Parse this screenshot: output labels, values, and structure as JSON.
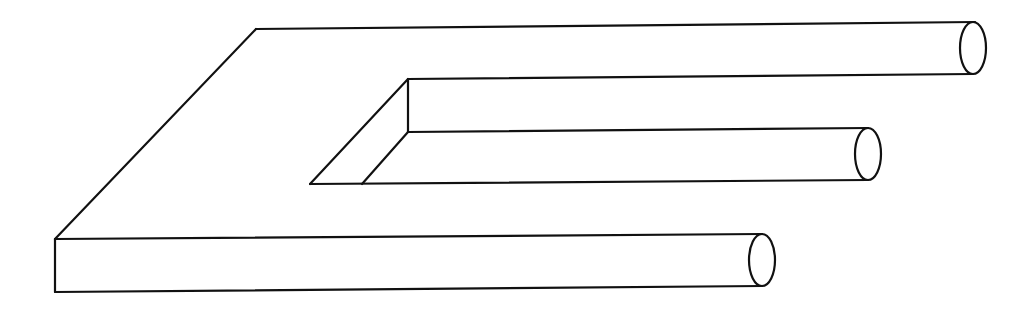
{
  "figure": {
    "title": "Impossible trident (blivet) optical illusion",
    "style": {
      "line_color": "#111111",
      "background": "#ffffff"
    },
    "outer_body": {
      "back_edge": [
        [
          256,
          29
        ],
        [
          975,
          22
        ]
      ],
      "left_diagonal": [
        [
          256,
          29
        ],
        [
          55,
          239
        ]
      ],
      "front_top_edge": [
        [
          55,
          239
        ],
        [
          762,
          234
        ]
      ],
      "front_left_edge": [
        [
          55,
          239
        ],
        [
          55,
          292
        ]
      ],
      "front_bottom_edge": [
        [
          55,
          292
        ],
        [
          762,
          286
        ]
      ]
    },
    "inner_notch": {
      "top_corner": [
        408,
        79
      ],
      "vertical_edge": [
        [
          408,
          79
        ],
        [
          408,
          132
        ]
      ],
      "outer_diagonal": [
        [
          408,
          79
        ],
        [
          310,
          184
        ]
      ],
      "inner_diagonal": [
        [
          408,
          132
        ],
        [
          362,
          184
        ]
      ],
      "floor_edge": [
        [
          310,
          184
        ],
        [
          868,
          180
        ]
      ],
      "upper_edge": [
        [
          408,
          79
        ],
        [
          973,
          74
        ]
      ],
      "middle_edge": [
        [
          408,
          132
        ],
        [
          868,
          128
        ]
      ]
    },
    "prongs": [
      {
        "name": "top-prong",
        "end_center": [
          973,
          48
        ],
        "rx": 13,
        "ry": 26
      },
      {
        "name": "middle-prong",
        "end_center": [
          868,
          154
        ],
        "rx": 13,
        "ry": 26
      },
      {
        "name": "bottom-prong",
        "end_center": [
          762,
          260
        ],
        "rx": 13,
        "ry": 26
      }
    ]
  }
}
